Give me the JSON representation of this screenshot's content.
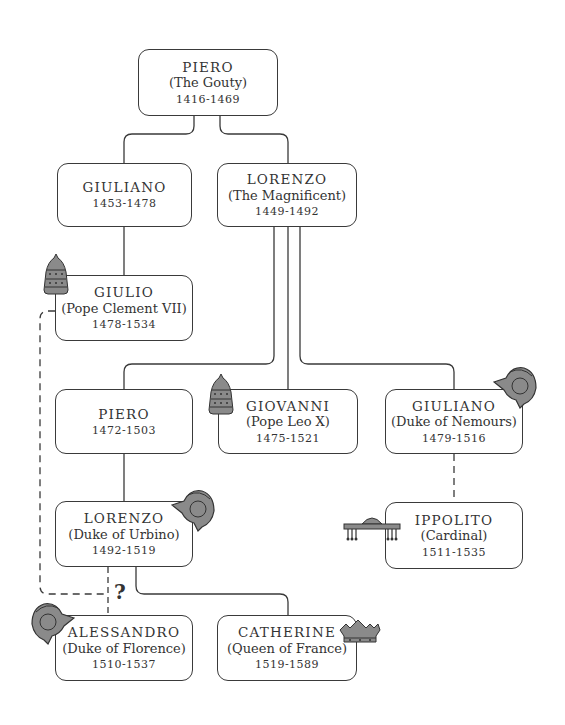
{
  "diagram": {
    "type": "family-tree",
    "line_color": "#3a3a3a",
    "emblem_fill": "#8a8a8a",
    "uncertain_marker": "?",
    "nodes": [
      {
        "id": "piero_gouty",
        "name": "PIERO",
        "title": "(The Gouty)",
        "dates": "1416-1469",
        "emblem": null
      },
      {
        "id": "giuliano_1453",
        "name": "GIULIANO",
        "title": "",
        "dates": "1453-1478",
        "emblem": null
      },
      {
        "id": "lorenzo_magnificent",
        "name": "LORENZO",
        "title": "(The Magnificent)",
        "dates": "1449-1492",
        "emblem": null
      },
      {
        "id": "giulio",
        "name": "GIULIO",
        "title": "(Pope Clement VII)",
        "dates": "1478-1534",
        "emblem": "papal-tiara"
      },
      {
        "id": "piero_1472",
        "name": "PIERO",
        "title": "",
        "dates": "1472-1503",
        "emblem": null
      },
      {
        "id": "giovanni",
        "name": "GIOVANNI",
        "title": "(Pope Leo X)",
        "dates": "1475-1521",
        "emblem": "papal-tiara"
      },
      {
        "id": "giuliano_nemours",
        "name": "GIULIANO",
        "title": "(Duke of Nemours)",
        "dates": "1479-1516",
        "emblem": "helmet"
      },
      {
        "id": "lorenzo_urbino",
        "name": "LORENZO",
        "title": "(Duke of Urbino)",
        "dates": "1492-1519",
        "emblem": "helmet"
      },
      {
        "id": "ippolito",
        "name": "IPPOLITO",
        "title": "(Cardinal)",
        "dates": "1511-1535",
        "emblem": "cardinal-hat"
      },
      {
        "id": "alessandro",
        "name": "ALESSANDRO",
        "title": "(Duke of Florence)",
        "dates": "1510-1537",
        "emblem": "helmet"
      },
      {
        "id": "catherine",
        "name": "CATHERINE",
        "title": "(Queen of France)",
        "dates": "1519-1589",
        "emblem": "crown"
      }
    ],
    "edges": [
      {
        "from": "piero_gouty",
        "to": "giuliano_1453",
        "style": "solid"
      },
      {
        "from": "piero_gouty",
        "to": "lorenzo_magnificent",
        "style": "solid"
      },
      {
        "from": "giuliano_1453",
        "to": "giulio",
        "style": "solid"
      },
      {
        "from": "lorenzo_magnificent",
        "to": "piero_1472",
        "style": "solid"
      },
      {
        "from": "lorenzo_magnificent",
        "to": "giovanni",
        "style": "solid"
      },
      {
        "from": "lorenzo_magnificent",
        "to": "giuliano_nemours",
        "style": "solid"
      },
      {
        "from": "piero_1472",
        "to": "lorenzo_urbino",
        "style": "solid"
      },
      {
        "from": "giuliano_nemours",
        "to": "ippolito",
        "style": "dashed"
      },
      {
        "from": "lorenzo_urbino",
        "to": "catherine",
        "style": "solid"
      },
      {
        "from": "lorenzo_urbino",
        "to": "alessandro",
        "style": "dashed",
        "uncertain": true
      },
      {
        "from": "giulio",
        "to": "alessandro",
        "style": "dashed",
        "uncertain": true
      }
    ]
  }
}
